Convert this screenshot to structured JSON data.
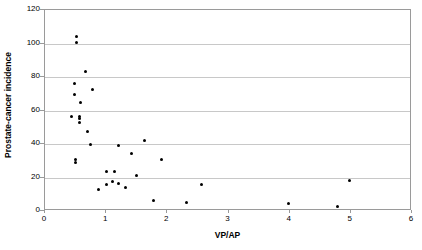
{
  "chart_data": {
    "type": "scatter",
    "title": "",
    "xlabel": "VP/AP",
    "ylabel": "Prostate-cancer incidence",
    "xlim": [
      0,
      6
    ],
    "ylim": [
      0,
      120
    ],
    "xticks": [
      0,
      1,
      2,
      3,
      4,
      5,
      6
    ],
    "yticks": [
      0,
      20,
      40,
      60,
      80,
      100,
      120
    ],
    "grid": "horizontal",
    "legend": null,
    "marker": {
      "shape": "circle",
      "color": "#000000",
      "size": 3
    },
    "points": [
      {
        "x": 0.52,
        "y": 104.0
      },
      {
        "x": 0.52,
        "y": 100.5
      },
      {
        "x": 0.66,
        "y": 83.5
      },
      {
        "x": 0.48,
        "y": 76.0
      },
      {
        "x": 0.78,
        "y": 72.5
      },
      {
        "x": 0.48,
        "y": 69.5
      },
      {
        "x": 0.58,
        "y": 65.0
      },
      {
        "x": 0.44,
        "y": 56.5
      },
      {
        "x": 0.56,
        "y": 56.5
      },
      {
        "x": 0.56,
        "y": 55.0
      },
      {
        "x": 0.56,
        "y": 53.0
      },
      {
        "x": 0.7,
        "y": 47.5
      },
      {
        "x": 0.74,
        "y": 40.0
      },
      {
        "x": 1.2,
        "y": 39.0
      },
      {
        "x": 1.62,
        "y": 42.0
      },
      {
        "x": 0.5,
        "y": 30.5
      },
      {
        "x": 0.5,
        "y": 29.0
      },
      {
        "x": 1.42,
        "y": 34.5
      },
      {
        "x": 1.9,
        "y": 30.5
      },
      {
        "x": 1.0,
        "y": 23.5
      },
      {
        "x": 1.14,
        "y": 23.5
      },
      {
        "x": 1.5,
        "y": 21.0
      },
      {
        "x": 0.88,
        "y": 13.0
      },
      {
        "x": 1.0,
        "y": 16.0
      },
      {
        "x": 1.1,
        "y": 17.5
      },
      {
        "x": 1.2,
        "y": 16.5
      },
      {
        "x": 1.32,
        "y": 14.0
      },
      {
        "x": 2.56,
        "y": 16.0
      },
      {
        "x": 1.78,
        "y": 6.0
      },
      {
        "x": 2.32,
        "y": 5.0
      },
      {
        "x": 3.98,
        "y": 4.5
      },
      {
        "x": 4.78,
        "y": 2.5
      },
      {
        "x": 4.98,
        "y": 18.0
      }
    ]
  }
}
